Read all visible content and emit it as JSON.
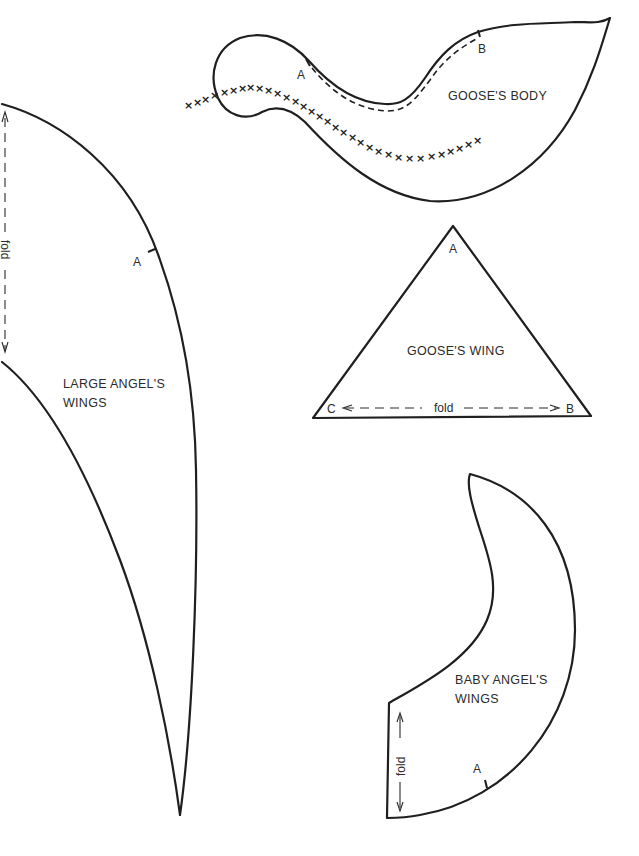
{
  "page": {
    "type": "sewing pattern pieces",
    "background_color": "#ffffff",
    "line_color": "#1f1f1f"
  },
  "pieces": {
    "goose_body": {
      "label": "GOOSE'S BODY",
      "point_a": "A",
      "point_b": "B",
      "stitch_marker": "×"
    },
    "large_angel_wings": {
      "label_line1": "LARGE ANGEL'S",
      "label_line2": "WINGS",
      "point_a": "A",
      "fold_label": "fold"
    },
    "goose_wing": {
      "label": "GOOSE'S WING",
      "point_a": "A",
      "point_b": "B",
      "point_c": "C",
      "fold_label": "fold"
    },
    "baby_angel_wings": {
      "label_line1": "BABY ANGEL'S",
      "label_line2": "WINGS",
      "point_a": "A",
      "fold_label": "fold"
    }
  }
}
